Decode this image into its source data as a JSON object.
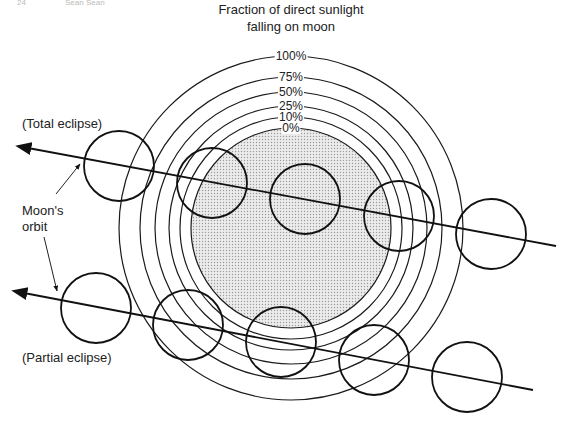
{
  "header_fragments": [
    "24",
    "Sean Sean"
  ],
  "title": {
    "line1": "Fraction of direct sunlight",
    "line2": "falling on moon"
  },
  "rings": [
    {
      "label": "100%",
      "r": 172
    },
    {
      "label": "75%",
      "r": 151
    },
    {
      "label": "50%",
      "r": 136
    },
    {
      "label": "25%",
      "r": 122
    },
    {
      "label": "10%",
      "r": 111
    },
    {
      "label": "0%",
      "r": 100
    }
  ],
  "shadow_center": {
    "x": 291,
    "y": 228
  },
  "shadow_fill": "#d9d9d9",
  "labels": {
    "total": "(Total eclipse)",
    "partial": "(Partial eclipse)",
    "orbit_line1": "Moon's",
    "orbit_line2": "orbit"
  },
  "orbits": {
    "total": {
      "x1": 28,
      "y1": 148,
      "x2": 556,
      "y2": 246
    },
    "partial": {
      "x1": 24,
      "y1": 293,
      "x2": 533,
      "y2": 390
    }
  },
  "moons": {
    "radius": 35,
    "total": [
      [
        119,
        166
      ],
      [
        212,
        183
      ],
      [
        305,
        199
      ],
      [
        399,
        216
      ],
      [
        491,
        234
      ]
    ],
    "partial": [
      [
        96,
        308
      ],
      [
        188,
        325
      ],
      [
        281,
        342
      ],
      [
        374,
        360
      ],
      [
        467,
        377
      ]
    ]
  }
}
